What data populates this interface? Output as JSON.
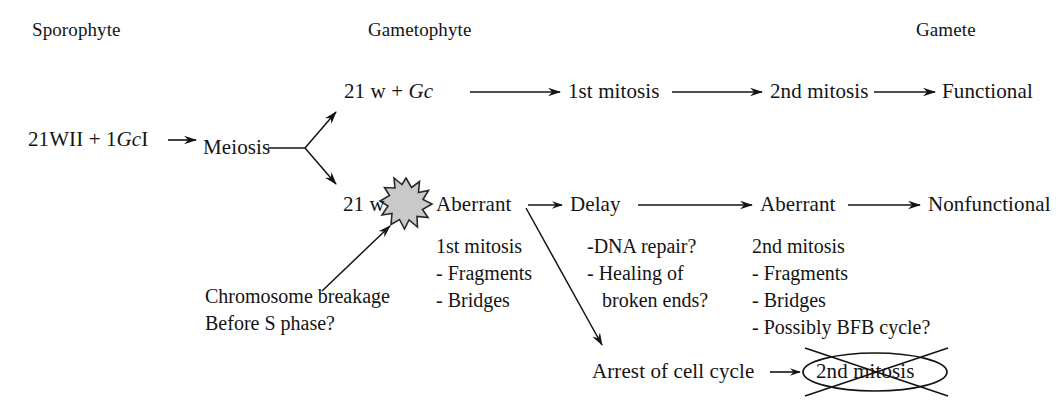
{
  "diagram": {
    "headers": [
      {
        "label": "Sporophyte"
      },
      {
        "label": "Gametophyte"
      },
      {
        "label": "Gamete"
      }
    ],
    "start_node": {
      "prefix": "21WII + 1",
      "italic": "Gc",
      "suffix": "I"
    },
    "meiosis": "Meiosis",
    "upper_path": {
      "genotype_prefix": "21 w + ",
      "genotype_italic": "Gc",
      "step1": "1st mitosis",
      "step2": "2nd mitosis",
      "outcome": "Functional"
    },
    "lower_path": {
      "genotype": "21 w",
      "aberrant_1": "Aberrant",
      "delay": "Delay",
      "aberrant_2": "Aberrant",
      "outcome": "Nonfunctional",
      "arrest": "Arrest of cell cycle",
      "arrest_target": "2nd mitosis"
    },
    "breakage_note": {
      "line1": "Chromosome breakage",
      "line2": "Before S phase?"
    },
    "first_mitosis_defects": [
      "1st mitosis",
      "- Fragments",
      "- Bridges"
    ],
    "delay_details": [
      "-DNA repair?",
      "- Healing of",
      "   broken ends?"
    ],
    "second_mitosis_defects": [
      "2nd mitosis",
      "- Fragments",
      "- Bridges",
      "- Possibly BFB cycle?"
    ],
    "colors": {
      "ink": "#141414",
      "burst_fill": "#c9c9c9",
      "burst_stroke": "#2a2a2a",
      "background": "#ffffff"
    }
  }
}
